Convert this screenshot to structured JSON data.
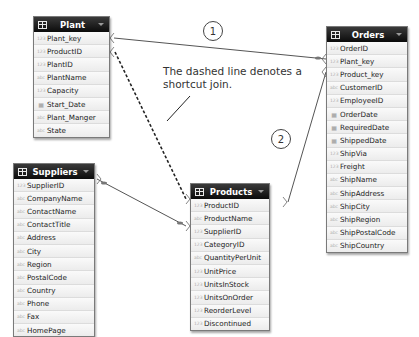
{
  "tables": {
    "plant": {
      "title": "Plant",
      "fields": [
        {
          "name": "Plant_key",
          "type": "number"
        },
        {
          "name": "ProductID",
          "type": "number"
        },
        {
          "name": "PlantID",
          "type": "number"
        },
        {
          "name": "PlantName",
          "type": "text"
        },
        {
          "name": "Capacity",
          "type": "number"
        },
        {
          "name": "Start_Date",
          "type": "date"
        },
        {
          "name": "Plant_Manger",
          "type": "text"
        },
        {
          "name": "State",
          "type": "text"
        }
      ]
    },
    "orders": {
      "title": "Orders",
      "fields": [
        {
          "name": "OrderID",
          "type": "number"
        },
        {
          "name": "Plant_key",
          "type": "number"
        },
        {
          "name": "Product_key",
          "type": "number"
        },
        {
          "name": "CustomerID",
          "type": "text"
        },
        {
          "name": "EmployeeID",
          "type": "number"
        },
        {
          "name": "OrderDate",
          "type": "date"
        },
        {
          "name": "RequiredDate",
          "type": "date"
        },
        {
          "name": "ShippedDate",
          "type": "date"
        },
        {
          "name": "ShipVia",
          "type": "number"
        },
        {
          "name": "Freight",
          "type": "number"
        },
        {
          "name": "ShipName",
          "type": "text"
        },
        {
          "name": "ShipAddress",
          "type": "text"
        },
        {
          "name": "ShipCity",
          "type": "text"
        },
        {
          "name": "ShipRegion",
          "type": "text"
        },
        {
          "name": "ShipPostalCode",
          "type": "text"
        },
        {
          "name": "ShipCountry",
          "type": "text"
        }
      ]
    },
    "suppliers": {
      "title": "Suppliers",
      "fields": [
        {
          "name": "SupplierID",
          "type": "number"
        },
        {
          "name": "CompanyName",
          "type": "text"
        },
        {
          "name": "ContactName",
          "type": "text"
        },
        {
          "name": "ContactTitle",
          "type": "text"
        },
        {
          "name": "Address",
          "type": "text"
        },
        {
          "name": "City",
          "type": "text"
        },
        {
          "name": "Region",
          "type": "text"
        },
        {
          "name": "PostalCode",
          "type": "text"
        },
        {
          "name": "Country",
          "type": "text"
        },
        {
          "name": "Phone",
          "type": "text"
        },
        {
          "name": "Fax",
          "type": "text"
        },
        {
          "name": "HomePage",
          "type": "text"
        }
      ]
    },
    "products": {
      "title": "Products",
      "fields": [
        {
          "name": "ProductID",
          "type": "number"
        },
        {
          "name": "ProductName",
          "type": "text"
        },
        {
          "name": "SupplierID",
          "type": "number"
        },
        {
          "name": "CategoryID",
          "type": "number"
        },
        {
          "name": "QuantityPerUnit",
          "type": "text"
        },
        {
          "name": "UnitPrice",
          "type": "number"
        },
        {
          "name": "UnitsInStock",
          "type": "number"
        },
        {
          "name": "UnitsOnOrder",
          "type": "number"
        },
        {
          "name": "ReorderLevel",
          "type": "number"
        },
        {
          "name": "Discontinued",
          "type": "number"
        }
      ]
    }
  },
  "annotations": {
    "callout": "The dashed line denotes a shortcut join.",
    "badge1": "1",
    "badge2": "2"
  },
  "icons": {
    "table": "grid-icon",
    "number": "123",
    "text": "abc",
    "date": "▦",
    "dropdown": "chevron-down-icon"
  },
  "colors": {
    "header_bg": "#111111",
    "header_text": "#ffffff",
    "row_bg": "#f0f0f0",
    "line": "#555555"
  }
}
